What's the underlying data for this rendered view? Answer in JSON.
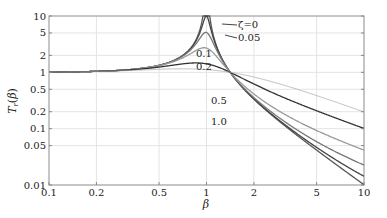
{
  "chart_data": {
    "type": "line",
    "title": "",
    "xlabel": "β",
    "ylabel": "T_r(β)",
    "xscale": "log",
    "yscale": "log",
    "xlim": [
      0.1,
      10
    ],
    "ylim": [
      0.01,
      10
    ],
    "grid": true,
    "x_ticks": [
      "0.1",
      "0.2",
      "0.5",
      "1",
      "2",
      "5",
      "10"
    ],
    "y_ticks": [
      "0.01",
      "0.05",
      "0.1",
      "0.2",
      "0.5",
      "1",
      "2",
      "5",
      "10"
    ],
    "formula": "T = sqrt((1+(2ζβ)^2)/((1-β^2)^2+(2ζβ)^2))",
    "series": [
      {
        "name": "ζ=0",
        "zeta": 0,
        "label": "ζ=0",
        "color": "#555555"
      },
      {
        "name": "0.05",
        "zeta": 0.05,
        "label": "0.05",
        "color": "#444444"
      },
      {
        "name": "0.1",
        "zeta": 0.1,
        "label": "0.1",
        "color": "#777777"
      },
      {
        "name": "0.2",
        "zeta": 0.2,
        "label": "0.2",
        "color": "#999999"
      },
      {
        "name": "0.5",
        "zeta": 0.5,
        "label": "0.5",
        "color": "#333333"
      },
      {
        "name": "1.0",
        "zeta": 1.0,
        "label": "1.0",
        "color": "#aaaaaa"
      }
    ],
    "sample_values": {
      "x": [
        0.1,
        0.2,
        0.5,
        1,
        2,
        5,
        10
      ],
      "zeta_0.05": [
        0.01,
        0.042,
        0.333,
        10.05,
        0.334,
        0.042,
        0.01
      ],
      "zeta_0.5": [
        0.01,
        0.043,
        0.396,
        1.414,
        0.632,
        0.209,
        0.1
      ],
      "zeta_1.0": [
        0.01,
        0.045,
        0.5,
        1.118,
        0.85,
        0.41,
        0.2
      ]
    },
    "annotations": [
      {
        "text": "ζ=0",
        "x": 1.2,
        "y": 8.5
      },
      {
        "text": "0.05",
        "x": 1.2,
        "y": 4.5
      },
      {
        "text": "0.1",
        "x": 0.95,
        "y": 2.8
      },
      {
        "text": "0.2",
        "x": 0.95,
        "y": 1.9
      },
      {
        "text": "0.5",
        "x": 1.05,
        "y": 0.7
      },
      {
        "text": "1.0",
        "x": 1.05,
        "y": 0.42
      }
    ]
  }
}
